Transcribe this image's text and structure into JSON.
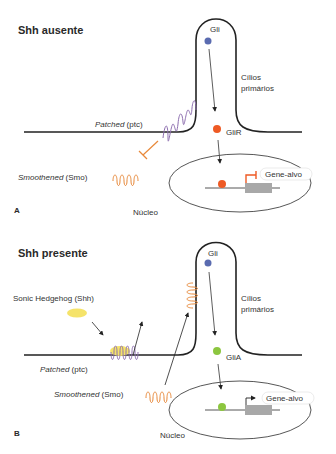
{
  "panel_a": {
    "title": "Shh ausente",
    "letter": "A",
    "gli": "Gli",
    "cilia": [
      "Cílios",
      "primários"
    ],
    "patched_italic": "Patched",
    "patched_rest": " (ptc)",
    "smo_italic": "Smoothened",
    "smo_rest": " (Smo)",
    "gli_state": "GliR",
    "target_gene": "Gene-alvo",
    "nucleus": "Núcleo"
  },
  "panel_b": {
    "title": "Shh presente",
    "letter": "B",
    "shh": "Sonic Hedgehog (Shh)",
    "gli": "Gli",
    "cilia": [
      "Cílios",
      "primários"
    ],
    "patched_italic": "Patched",
    "patched_rest": " (ptc)",
    "smo_italic": "Smoothened",
    "smo_rest": " (Smo)",
    "gli_state": "GliA",
    "target_gene": "Gene-alvo",
    "nucleus": "Núcleo"
  },
  "colors": {
    "gli": "#5a6bb0",
    "glir": "#ee5a24",
    "glia": "#8cc63f",
    "ptc": "#8e6fb0",
    "smo": "#e8893a",
    "shh": "#f5e36a",
    "gene_box": "#a8a8a8"
  },
  "caption": "Figura 17.12 — Via de sinalização Sonic Hedgehog"
}
